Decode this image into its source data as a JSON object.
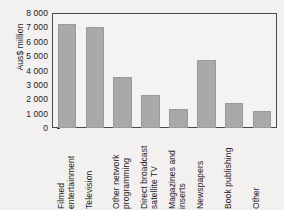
{
  "chart_data": {
    "type": "bar",
    "title": "",
    "subtitle": "",
    "xlabel": "",
    "ylabel": "Aus$ million",
    "ylim": [
      0,
      8000
    ],
    "ytick_step": 1000,
    "yticks": [
      "8 000",
      "7 000",
      "6 000",
      "5 000",
      "4 000",
      "3 000",
      "2 000",
      "1 000",
      "0"
    ],
    "ytick_values": [
      8000,
      7000,
      6000,
      5000,
      4000,
      3000,
      2000,
      1000,
      0
    ],
    "grid": false,
    "legend": null,
    "legend_position": "none",
    "categories": [
      "Filmed entertainment",
      "Television",
      "Other network programming",
      "Direct broadcast satellite TV",
      "Magazines and inserts",
      "Newspapers",
      "Book publishing",
      "Other"
    ],
    "values": [
      7250,
      7000,
      3550,
      2330,
      1330,
      4750,
      1750,
      1180
    ],
    "bar_color": "#a9a9a9",
    "plot_background": "#f4f3f1",
    "figure_background": "#f2f1ef",
    "axis_color": "#4a4a4a",
    "text_color": "#1c1c1c"
  }
}
